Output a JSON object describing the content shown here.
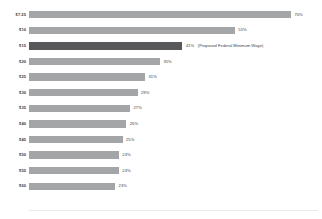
{
  "chart_data": {
    "type": "bar",
    "orientation": "horizontal",
    "title": "",
    "subtitle": "",
    "xlabel": "",
    "ylabel": "",
    "xlim": [
      0,
      100
    ],
    "grid": false,
    "legend": null,
    "categories": [
      "$7.25",
      "$10",
      "$15",
      "$20",
      "$25",
      "$30",
      "$35",
      "$40",
      "$45",
      "$50",
      "$55",
      "$60"
    ],
    "values": [
      70,
      55,
      41,
      35,
      31,
      29,
      27,
      26,
      25,
      24,
      24,
      23
    ],
    "value_labels": [
      "70%",
      "55%",
      "41%",
      "35%",
      "31%",
      "29%",
      "27%",
      "26%",
      "25%",
      "24%",
      "24%",
      "23%"
    ],
    "annotations": [
      {
        "category": "$15",
        "text": "(Proposed Federal Minimum Wage)"
      }
    ],
    "colors": {
      "bar": "#a3a5a7",
      "highlight_bar": "#56585a",
      "text": "#3d3d3d",
      "background": "#ffffff",
      "baseline": "#e9e9e9"
    },
    "highlighted_category": "$15",
    "rows": [
      {
        "label": "$7.25",
        "value": 70,
        "value_label": "70%",
        "highlight": false,
        "annotation": ""
      },
      {
        "label": "$10",
        "value": 55,
        "value_label": "55%",
        "highlight": false,
        "annotation": ""
      },
      {
        "label": "$15",
        "value": 41,
        "value_label": "41%",
        "highlight": true,
        "annotation": "(Proposed Federal Minimum Wage)"
      },
      {
        "label": "$20",
        "value": 35,
        "value_label": "35%",
        "highlight": false,
        "annotation": ""
      },
      {
        "label": "$25",
        "value": 31,
        "value_label": "31%",
        "highlight": false,
        "annotation": ""
      },
      {
        "label": "$30",
        "value": 29,
        "value_label": "29%",
        "highlight": false,
        "annotation": ""
      },
      {
        "label": "$35",
        "value": 27,
        "value_label": "27%",
        "highlight": false,
        "annotation": ""
      },
      {
        "label": "$40",
        "value": 26,
        "value_label": "26%",
        "highlight": false,
        "annotation": ""
      },
      {
        "label": "$45",
        "value": 25,
        "value_label": "25%",
        "highlight": false,
        "annotation": ""
      },
      {
        "label": "$50",
        "value": 24,
        "value_label": "24%",
        "highlight": false,
        "annotation": ""
      },
      {
        "label": "$55",
        "value": 24,
        "value_label": "24%",
        "highlight": false,
        "annotation": ""
      },
      {
        "label": "$60",
        "value": 23,
        "value_label": "23%",
        "highlight": false,
        "annotation": ""
      }
    ]
  }
}
